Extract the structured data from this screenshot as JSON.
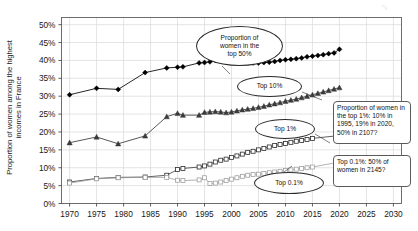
{
  "chart_data": {
    "type": "line",
    "title": "",
    "xlabel": "",
    "ylabel": "Proportion of women among the highest\nincomes in France",
    "xlim": [
      1968.5,
      2031.5
    ],
    "ylim": [
      0,
      52
    ],
    "grid": true,
    "grid_axes": "both",
    "legend": "none (inline oval labels)",
    "xticks": [
      1970,
      1975,
      1980,
      1985,
      1990,
      1995,
      2000,
      2005,
      2010,
      2015,
      2020,
      2025,
      2030
    ],
    "yticks": [
      "0%",
      "5%",
      "10%",
      "15%",
      "20%",
      "25%",
      "30%",
      "35%",
      "40%",
      "45%",
      "50%"
    ],
    "ytick_values": [
      0,
      5,
      10,
      15,
      20,
      25,
      30,
      35,
      40,
      45,
      50
    ],
    "series": [
      {
        "name": "Proportion of women in the top 50%",
        "marker": "filled-diamond",
        "color": "#000000",
        "x": [
          1970,
          1975,
          1979,
          1984,
          1988,
          1990,
          1991,
          1994,
          1995,
          1996,
          1997,
          1998,
          1999,
          2000,
          2001,
          2002,
          2003,
          2004,
          2005,
          2006,
          2007,
          2008,
          2009,
          2010,
          2011,
          2012,
          2013,
          2014,
          2015,
          2016,
          2017,
          2018,
          2019,
          2020
        ],
        "values": [
          30.4,
          32.2,
          31.9,
          36.6,
          37.9,
          38.1,
          38.2,
          39.3,
          39.4,
          39.6,
          40.0,
          40.2,
          40.0,
          39.8,
          39.6,
          39.5,
          39.4,
          39.3,
          39.3,
          39.4,
          39.5,
          39.7,
          40.0,
          40.2,
          40.3,
          40.5,
          40.7,
          41.0,
          41.2,
          41.4,
          41.6,
          41.9,
          42.1,
          43.1
        ]
      },
      {
        "name": "Top 10%",
        "marker": "filled-triangle",
        "color": "#3a3a3a",
        "x": [
          1970,
          1975,
          1979,
          1984,
          1988,
          1990,
          1991,
          1994,
          1995,
          1996,
          1997,
          1998,
          1999,
          2000,
          2001,
          2002,
          2003,
          2004,
          2005,
          2006,
          2007,
          2008,
          2009,
          2010,
          2011,
          2012,
          2013,
          2014,
          2015,
          2016,
          2017,
          2018,
          2019,
          2020
        ],
        "values": [
          17.0,
          18.6,
          16.7,
          18.9,
          24.3,
          25.2,
          24.7,
          24.7,
          25.5,
          25.6,
          25.7,
          25.6,
          25.4,
          25.6,
          25.9,
          26.2,
          26.4,
          26.6,
          26.9,
          27.2,
          27.6,
          27.9,
          28.2,
          28.6,
          28.9,
          29.2,
          29.6,
          30.0,
          30.4,
          30.8,
          31.2,
          31.6,
          32.0,
          32.4
        ]
      },
      {
        "name": "Top 1%",
        "marker": "open-square",
        "color": "#2b2b2b",
        "x": [
          1970,
          1975,
          1979,
          1984,
          1988,
          1990,
          1991,
          1994,
          1995,
          1996,
          1997,
          1998,
          1999,
          2000,
          2001,
          2002,
          2003,
          2004,
          2005,
          2006,
          2007,
          2008,
          2009,
          2010,
          2011,
          2012,
          2013,
          2014,
          2015,
          2020
        ],
        "values": [
          6.0,
          7.0,
          7.3,
          7.4,
          7.9,
          9.5,
          9.8,
          10.2,
          10.5,
          11.0,
          11.6,
          12.1,
          12.4,
          12.9,
          13.3,
          13.8,
          14.3,
          14.6,
          15.0,
          15.4,
          15.8,
          16.2,
          16.5,
          16.8,
          17.1,
          17.4,
          17.6,
          17.9,
          18.2,
          19.0
        ]
      },
      {
        "name": "Top 0.1%",
        "marker": "open-square-light",
        "color": "#9a9a9a",
        "x": [
          1970,
          1975,
          1979,
          1984,
          1988,
          1990,
          1991,
          1994,
          1995,
          1996,
          1997,
          1998,
          1999,
          2000,
          2001,
          2002,
          2003,
          2004,
          2005,
          2006,
          2007,
          2008,
          2009,
          2010,
          2011,
          2012,
          2013,
          2014,
          2015,
          2020
        ],
        "values": [
          5.7,
          6.9,
          7.2,
          7.3,
          7.3,
          6.5,
          6.4,
          6.6,
          7.2,
          5.6,
          5.7,
          6.0,
          6.4,
          6.8,
          7.2,
          7.6,
          7.9,
          8.1,
          8.2,
          8.4,
          8.6,
          8.8,
          9.0,
          9.2,
          9.4,
          9.6,
          9.8,
          10.0,
          10.2,
          11.6
        ]
      }
    ],
    "annotations": [
      {
        "name": "top-50-oval",
        "text": "Proportion of\nwomen in the\ntop 50%",
        "shape": "ellipse"
      },
      {
        "name": "top-10-oval",
        "text": "Top 10%",
        "shape": "ellipse"
      },
      {
        "name": "top-1-oval",
        "text": "Top 1%",
        "shape": "ellipse"
      },
      {
        "name": "top-01-oval",
        "text": "Top 0.1%",
        "shape": "ellipse"
      },
      {
        "name": "top-1-callout",
        "text": "Proportion of women in the top 1%: 10% in 1995, 19% in 2020, 50% in 2107?",
        "shape": "rounded-rect"
      },
      {
        "name": "top-01-callout",
        "text": "Top 0.1%: 50% of women in 2145?",
        "shape": "rounded-rect"
      }
    ]
  }
}
